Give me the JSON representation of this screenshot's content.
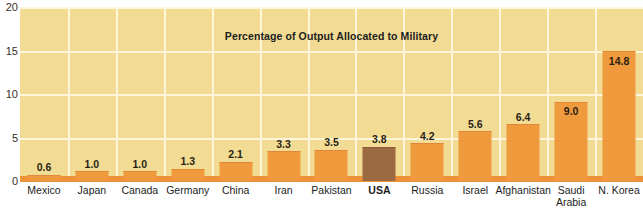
{
  "chart_data": {
    "type": "bar",
    "title": "Percentage of Output Allocated to Military",
    "xlabel": "",
    "ylabel": "",
    "ylim": [
      0,
      20
    ],
    "yticks": [
      0,
      5,
      10,
      15,
      20
    ],
    "grid": true,
    "legend": "none",
    "categories": [
      "Mexico",
      "Japan",
      "Canada",
      "Germany",
      "China",
      "Iran",
      "Pakistan",
      "USA",
      "Russia",
      "Israel",
      "Afghanistan",
      "Saudi\nArabia",
      "N. Korea"
    ],
    "values": [
      0.6,
      1.0,
      1.0,
      1.3,
      2.1,
      3.3,
      3.5,
      3.8,
      4.2,
      5.6,
      6.4,
      9.0,
      14.8
    ],
    "value_labels": [
      "0.6",
      "1.0",
      "1.0",
      "1.3",
      "2.1",
      "3.3",
      "3.5",
      "3.8",
      "4.2",
      "5.6",
      "6.4",
      "9.0",
      "14.8"
    ],
    "highlight_index": 7,
    "colors": {
      "plot_background": "#f2dc94",
      "gridline": "#fdf6dd",
      "bar": "#ef9a3d",
      "bar_highlight": "#9c6a41",
      "axis": "#ee9237",
      "text": "#1d1d1d",
      "page_background": "#ffffff"
    }
  }
}
